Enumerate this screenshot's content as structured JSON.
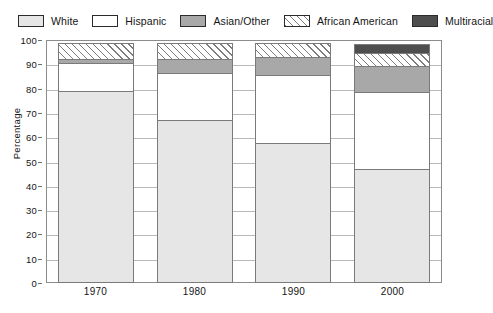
{
  "legend": {
    "position": "top",
    "items": [
      {
        "label": "White",
        "swatch": "light-gray-fill",
        "color": "#e6e6e6"
      },
      {
        "label": "Hispanic",
        "swatch": "white-fill",
        "color": "#ffffff"
      },
      {
        "label": "Asian/Other",
        "swatch": "medium-gray-fill",
        "color": "#a8a8a8"
      },
      {
        "label": "African American",
        "swatch": "diagonal-hatch",
        "color": "#7d7d7d"
      },
      {
        "label": "Multiracial",
        "swatch": "dark-gray-fill",
        "color": "#4e4e4e"
      }
    ]
  },
  "axes": {
    "y_label": "Percentage",
    "y_ticks": [
      "0",
      "10",
      "20",
      "30",
      "40",
      "50",
      "60",
      "70",
      "80",
      "90",
      "100"
    ],
    "x_ticks": [
      "1970",
      "1980",
      "1990",
      "2000"
    ]
  },
  "chart_data": {
    "type": "bar",
    "stacked": true,
    "title": "",
    "xlabel": "",
    "ylabel": "Percentage",
    "ylim": [
      0,
      100
    ],
    "ytick_step": 10,
    "grid": true,
    "legend_position": "top",
    "categories": [
      "1970",
      "1980",
      "1990",
      "2000"
    ],
    "series": [
      {
        "name": "White",
        "values": [
          79,
          67,
          57.5,
          47
        ]
      },
      {
        "name": "Hispanic",
        "values": [
          12,
          20,
          28.5,
          32
        ]
      },
      {
        "name": "Asian/Other",
        "values": [
          2,
          6,
          8,
          11
        ]
      },
      {
        "name": "African American",
        "values": [
          7,
          7,
          6,
          6
        ]
      },
      {
        "name": "Multiracial",
        "values": [
          0,
          0,
          0,
          4
        ]
      }
    ],
    "cumulative_tops": {
      "1970": [
        79,
        91,
        93,
        100,
        100
      ],
      "1980": [
        67,
        87,
        93,
        100,
        100
      ],
      "1990": [
        57.5,
        86,
        94,
        100,
        100
      ],
      "2000": [
        47,
        79,
        90,
        96,
        100
      ]
    }
  }
}
